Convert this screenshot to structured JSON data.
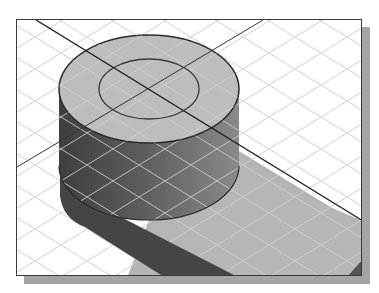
{
  "figure": {
    "colors": {
      "background": "#ffffff",
      "frame_border": "#3a3a3a",
      "frame_shadow": "#a4a4a4",
      "grid_line": "#d8d8d8",
      "grid_line_on_dark": "#c8c8c8",
      "top_face": "#bdbdbd",
      "side_dark": "#4a4a4a",
      "side_mid": "#6e6e6e",
      "side_light": "#8c8c8c",
      "cast_shadow_light": "#b4b4b4",
      "cast_shadow_dark": "#444444",
      "edge_line": "#2a2a2a",
      "axis_line": "#222222"
    },
    "cylinder": {
      "top_center": [
        148,
        88
      ],
      "bottom_center": [
        148,
        165
      ],
      "rx": 90,
      "ry": 54,
      "inner_circle": {
        "rx": 50,
        "ry": 30
      }
    },
    "axes": [
      {
        "name": "axis-line-main",
        "from": [
          35,
          19
        ],
        "to": [
          362,
          220
        ]
      },
      {
        "name": "axis-line-secondary",
        "from": [
          262,
          19
        ],
        "to": [
          16,
          166
        ]
      }
    ]
  }
}
